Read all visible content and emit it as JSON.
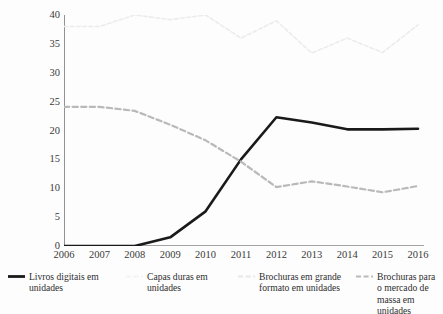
{
  "chart_data": {
    "type": "line",
    "title": "",
    "xlabel": "",
    "ylabel": "Percenatual",
    "ylim": [
      0,
      40
    ],
    "yticks": [
      0,
      5,
      10,
      15,
      20,
      25,
      30,
      35,
      40
    ],
    "grid": false,
    "legend_position": "bottom",
    "categories": [
      "2006",
      "2007",
      "2008",
      "2009",
      "2010",
      "2011",
      "2012",
      "2013",
      "2014",
      "2015",
      "2016"
    ],
    "series": [
      {
        "name": "Livros digitais em unidades",
        "color": "#1a1a1a",
        "style": "solid",
        "width": 2.6,
        "values": [
          0,
          0,
          0,
          1.5,
          6.0,
          15.0,
          22.3,
          21.4,
          20.2,
          20.2,
          20.3
        ]
      },
      {
        "name": "Capas duras em unidades",
        "color": "#f2f2f2",
        "style": "dashed",
        "width": 1.4,
        "values": [
          null,
          null,
          null,
          null,
          null,
          null,
          null,
          null,
          null,
          null,
          null
        ]
      },
      {
        "name": "Brochuras em grande formato em unidades",
        "color": "#ececec",
        "style": "dashed",
        "width": 1.6,
        "values": [
          38.0,
          38.0,
          40.0,
          39.2,
          40.0,
          36.0,
          39.0,
          33.4,
          36.0,
          33.5,
          38.3
        ]
      },
      {
        "name": "Brochuras para o mercado de massa em unidades",
        "color": "#b9b9b9",
        "style": "dashed",
        "width": 2.2,
        "values": [
          24.1,
          24.1,
          23.4,
          21.0,
          18.3,
          14.6,
          10.2,
          11.2,
          10.3,
          9.3,
          10.4
        ]
      }
    ]
  },
  "axis": {
    "y_label": "Percenatual",
    "y_tick_labels": [
      "40",
      "35",
      "30",
      "25",
      "20",
      "15",
      "10",
      "5",
      "0"
    ],
    "x_tick_labels": [
      "2006",
      "2007",
      "2008",
      "2009",
      "2010",
      "2011",
      "2012",
      "2013",
      "2014",
      "2015",
      "2016"
    ]
  },
  "legend": {
    "items": [
      {
        "label": "Livros digitais em unidades",
        "color": "#1a1a1a",
        "style": "solid"
      },
      {
        "label": "Capas duras em unidades",
        "color": "#f4f4f4",
        "style": "dashed"
      },
      {
        "label": "Brochuras em grande formato em unidades",
        "color": "#e8e8e8",
        "style": "dashed"
      },
      {
        "label": "Brochuras para o mercado de massa em unidades",
        "color": "#b9b9b9",
        "style": "dashed"
      }
    ]
  },
  "colors": {
    "axis": "#4a4a4a",
    "text": "#2e2e2e",
    "background": "#fdfdfd"
  }
}
